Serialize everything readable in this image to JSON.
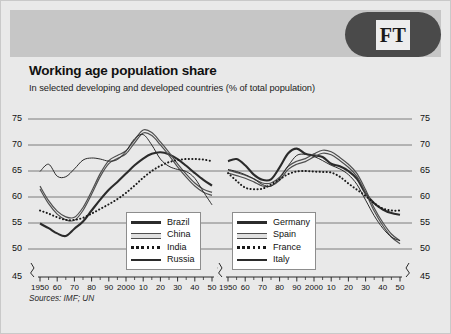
{
  "brand": {
    "logo_text": "FT",
    "logo_name": "ft-logo"
  },
  "header": {
    "title": "Working age population share",
    "subtitle": "In selected developing and developed countries (% of total population)"
  },
  "footer": {
    "source": "Sources: IMF; UN"
  },
  "colors": {
    "page_background": "#e9e9e9",
    "header_band": "#c6c6c6",
    "logo_fill": "#4a4a4a",
    "gridline": "#6f6f6f",
    "line_dark": "#2b2b2b",
    "line_mid": "#4f4f4f",
    "line_light": "#8a8a8a"
  },
  "legends": {
    "left": {
      "items": [
        {
          "label": "Brazil",
          "style": "solid-thick"
        },
        {
          "label": "China",
          "style": "double"
        },
        {
          "label": "India",
          "style": "dotted"
        },
        {
          "label": "Russia",
          "style": "solid-thin"
        }
      ]
    },
    "right": {
      "items": [
        {
          "label": "Germany",
          "style": "solid-thick"
        },
        {
          "label": "Spain",
          "style": "double"
        },
        {
          "label": "France",
          "style": "dotted"
        },
        {
          "label": "Italy",
          "style": "solid-thin"
        }
      ]
    }
  },
  "chart_data": [
    {
      "id": "developing",
      "type": "line",
      "title": "Working age population share",
      "subtitle": "In selected developing and developed countries (% of total population)",
      "xlabel": "",
      "ylabel": "% of total population",
      "xlim": [
        1950,
        2050
      ],
      "ylim": [
        45,
        75
      ],
      "y_axis_break": true,
      "y_break_between": [
        45,
        50
      ],
      "yticks": [
        45,
        50,
        55,
        60,
        65,
        70,
        75
      ],
      "ytick_labels": [
        "45",
        "50",
        "55",
        "60",
        "65",
        "70",
        "75"
      ],
      "xticks": [
        1950,
        1960,
        1970,
        1980,
        1990,
        2000,
        2010,
        2020,
        2030,
        2040,
        2050
      ],
      "xtick_labels": [
        "1950",
        "60",
        "70",
        "80",
        "90",
        "2000",
        "10",
        "20",
        "30",
        "40",
        "50"
      ],
      "minor_tick_interval": 5,
      "grid": true,
      "legend_position": "inside-bottom-center",
      "x": [
        1950,
        1955,
        1960,
        1965,
        1970,
        1975,
        1980,
        1985,
        1990,
        1995,
        2000,
        2005,
        2010,
        2015,
        2020,
        2025,
        2030,
        2035,
        2040,
        2045,
        2050
      ],
      "series": [
        {
          "name": "Brazil",
          "style": "solid-thick",
          "values": [
            54.9,
            54.0,
            53.0,
            52.5,
            53.9,
            55.3,
            57.4,
            59.5,
            61.4,
            62.9,
            64.5,
            66.1,
            67.4,
            68.3,
            68.6,
            68.2,
            67.3,
            66.0,
            64.6,
            63.3,
            62.2
          ]
        },
        {
          "name": "China",
          "style": "double",
          "values": [
            61.8,
            59.0,
            57.0,
            55.9,
            55.8,
            57.7,
            60.8,
            64.2,
            66.7,
            67.7,
            68.6,
            70.7,
            72.6,
            72.1,
            70.3,
            68.3,
            66.1,
            64.1,
            62.4,
            61.2,
            60.6
          ]
        },
        {
          "name": "India",
          "style": "dotted",
          "values": [
            57.4,
            56.8,
            56.1,
            55.6,
            55.6,
            56.0,
            56.8,
            57.7,
            58.6,
            59.6,
            60.8,
            62.2,
            63.7,
            65.0,
            66.0,
            66.7,
            67.1,
            67.3,
            67.3,
            67.2,
            66.9
          ]
        },
        {
          "name": "Russia",
          "style": "solid-thin",
          "values": [
            64.9,
            66.3,
            64.0,
            63.9,
            65.4,
            67.1,
            67.5,
            67.3,
            66.9,
            67.2,
            68.8,
            71.2,
            72.0,
            70.0,
            67.3,
            65.9,
            65.3,
            64.9,
            63.6,
            61.0,
            58.5
          ]
        }
      ]
    },
    {
      "id": "developed",
      "type": "line",
      "xlim": [
        1950,
        2050
      ],
      "ylim": [
        45,
        75
      ],
      "y_axis_break": true,
      "y_break_between": [
        45,
        50
      ],
      "yticks": [
        45,
        50,
        55,
        60,
        65,
        70,
        75
      ],
      "ytick_labels": [
        "45",
        "50",
        "55",
        "60",
        "65",
        "70",
        "75"
      ],
      "xticks": [
        1950,
        1960,
        1970,
        1980,
        1990,
        2000,
        2010,
        2020,
        2030,
        2040,
        2050
      ],
      "xtick_labels": [
        "1950",
        "60",
        "70",
        "80",
        "90",
        "2000",
        "10",
        "20",
        "30",
        "40",
        "50"
      ],
      "minor_tick_interval": 5,
      "grid": true,
      "legend_position": "inside-bottom-left",
      "x": [
        1950,
        1955,
        1960,
        1965,
        1970,
        1975,
        1980,
        1985,
        1990,
        1995,
        2000,
        2005,
        2010,
        2015,
        2020,
        2025,
        2030,
        2035,
        2040,
        2045,
        2050
      ],
      "series": [
        {
          "name": "Germany",
          "style": "solid-thick",
          "values": [
            66.9,
            67.3,
            66.1,
            64.3,
            63.3,
            63.4,
            65.7,
            68.4,
            69.3,
            68.3,
            68.0,
            67.7,
            66.4,
            65.9,
            65.0,
            63.5,
            60.7,
            58.8,
            57.6,
            56.9,
            56.6
          ]
        },
        {
          "name": "Spain",
          "style": "double",
          "values": [
            64.9,
            64.4,
            63.9,
            63.2,
            62.4,
            62.4,
            63.5,
            65.6,
            66.6,
            67.1,
            68.0,
            68.7,
            68.4,
            67.3,
            66.0,
            64.2,
            61.1,
            57.6,
            54.8,
            52.6,
            51.3
          ]
        },
        {
          "name": "France",
          "style": "dotted",
          "values": [
            64.6,
            63.1,
            61.8,
            61.5,
            61.6,
            62.4,
            63.4,
            64.4,
            64.9,
            65.0,
            64.9,
            64.8,
            64.7,
            63.9,
            62.6,
            61.4,
            60.2,
            58.8,
            57.8,
            57.4,
            57.4
          ]
        },
        {
          "name": "Italy",
          "style": "solid-thin",
          "values": [
            65.3,
            64.9,
            64.3,
            63.5,
            62.4,
            62.1,
            63.6,
            66.0,
            68.0,
            68.2,
            67.8,
            67.0,
            66.1,
            65.4,
            64.3,
            62.4,
            59.4,
            56.4,
            54.0,
            52.3,
            51.6
          ]
        }
      ]
    }
  ]
}
